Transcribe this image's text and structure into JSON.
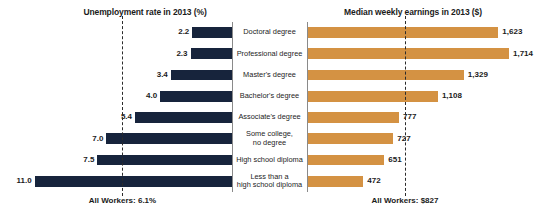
{
  "left_panel": {
    "title": "Unemployment rate in 2013 (%)",
    "average_label": "All Workers: 6.1%"
  },
  "right_panel": {
    "title": "Median weekly earnings in 2013 ($)",
    "average_label": "All Workers: $827"
  },
  "categories": [
    "Doctoral degree",
    "Professional degree",
    "Master's degree",
    "Bachelor's degree",
    "Associate's degree",
    "Some college,\nno degree",
    "High school diploma",
    "Less than a\nhigh school diploma"
  ],
  "unemployment_labels": [
    "2.2",
    "2.3",
    "3.4",
    "4.0",
    "5.4",
    "7.0",
    "7.5",
    "11.0"
  ],
  "earnings_labels": [
    "1,623",
    "1,714",
    "1,329",
    "1,108",
    "777",
    "727",
    "651",
    "472"
  ],
  "colors": {
    "unemployment_bar": "#17243c",
    "earnings_bar": "#d49243",
    "axis": "#8a8a8a",
    "reference_line": "#2b2b2b",
    "text": "#1b1b1b",
    "background": "#ffffff"
  },
  "chart_data": {
    "type": "bar",
    "orientation": "horizontal",
    "categories": [
      "Doctoral degree",
      "Professional degree",
      "Master's degree",
      "Bachelor's degree",
      "Associate's degree",
      "Some college, no degree",
      "High school diploma",
      "Less than a high school diploma"
    ],
    "panels": [
      {
        "title": "Unemployment rate in 2013 (%)",
        "xlabel": "Unemployment rate (%)",
        "ylabel": "",
        "direction": "right-to-left",
        "values": [
          2.2,
          2.3,
          3.4,
          4.0,
          5.4,
          7.0,
          7.5,
          11.0
        ],
        "data_labels": [
          "2.2",
          "2.3",
          "3.4",
          "4.0",
          "5.4",
          "7.0",
          "7.5",
          "11.0"
        ],
        "xlim": [
          0,
          11.0
        ],
        "grid": false,
        "bar_color": "#17243c",
        "reference_line": {
          "value": 6.1,
          "label": "All Workers: 6.1%",
          "style": "dashed"
        }
      },
      {
        "title": "Median weekly earnings in 2013 ($)",
        "xlabel": "Median weekly earnings ($)",
        "ylabel": "",
        "direction": "left-to-right",
        "values": [
          1623,
          1714,
          1329,
          1108,
          777,
          727,
          651,
          472
        ],
        "data_labels": [
          "1,623",
          "1,714",
          "1,329",
          "1,108",
          "777",
          "727",
          "651",
          "472"
        ],
        "xlim": [
          0,
          1714
        ],
        "grid": false,
        "bar_color": "#d49243",
        "reference_line": {
          "value": 827,
          "label": "All Workers: $827",
          "style": "dashed"
        }
      }
    ],
    "legend": [],
    "annotations": [
      "All Workers: 6.1%",
      "All Workers: $827"
    ]
  }
}
